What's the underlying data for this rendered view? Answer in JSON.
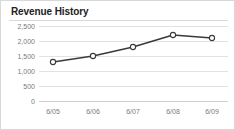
{
  "card": {
    "title": "Revenue History",
    "background_color": "#ffffff",
    "border_color": "#d8d8d8"
  },
  "chart_data": {
    "type": "line",
    "title": "Revenue History",
    "xlabel": "",
    "ylabel": "",
    "categories": [
      "6/05",
      "6/06",
      "6/07",
      "6/08",
      "6/09"
    ],
    "values": [
      1300,
      1500,
      1800,
      2200,
      2100
    ],
    "series": [
      {
        "name": "Revenue",
        "values": [
          1300,
          1500,
          1800,
          2200,
          2100
        ],
        "line_color": "#3a3a3a",
        "marker_fill": "#ffffff",
        "marker_shape": "circle"
      }
    ],
    "ylim": [
      0,
      2500
    ],
    "y_ticks": [
      0,
      500,
      1000,
      1500,
      2000,
      2500
    ],
    "y_tick_labels": [
      "0",
      "500",
      "1,000",
      "1,500",
      "2,000",
      "2,500"
    ],
    "x_tick_labels": [
      "6/05",
      "6/06",
      "6/07",
      "6/08",
      "6/09"
    ],
    "grid": true,
    "grid_color": "#e2e2e2",
    "legend": false,
    "legend_position": "none"
  }
}
